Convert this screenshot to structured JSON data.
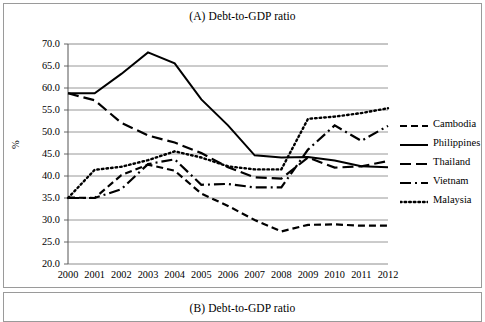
{
  "panel_a": {
    "title": "(A) Debt-to-GDP ratio"
  },
  "panel_b": {
    "title": "(B) Debt-to-GDP ratio"
  },
  "chart_data": {
    "type": "line",
    "title": "(A) Debt-to-GDP ratio",
    "xlabel": "",
    "ylabel": "%",
    "ylim": [
      20.0,
      70.0
    ],
    "ytick_step": 5.0,
    "grid": "horizontal",
    "legend_position": "right",
    "ytick_labels": [
      "70.0",
      "65.0",
      "60.0",
      "55.0",
      "50.0",
      "45.0",
      "40.0",
      "35.0",
      "30.0",
      "25.0",
      "20.0"
    ],
    "categories": [
      "2000",
      "2001",
      "2002",
      "2003",
      "2004",
      "2005",
      "2006",
      "2007",
      "2008",
      "2009",
      "2010",
      "2011",
      "2012"
    ],
    "x": [
      2000,
      2001,
      2002,
      2003,
      2004,
      2005,
      2006,
      2007,
      2008,
      2009,
      2010,
      2011,
      2012
    ],
    "series": [
      {
        "name": "Cambodia",
        "style": "dashed",
        "values": [
          35.1,
          35.0,
          40.2,
          42.6,
          41.2,
          36.0,
          33.2,
          30.0,
          27.4,
          28.9,
          29.0,
          28.7,
          28.7
        ]
      },
      {
        "name": "Philippines",
        "style": "solid",
        "values": [
          58.8,
          58.8,
          63.2,
          68.1,
          65.6,
          57.4,
          51.5,
          44.7,
          44.2,
          44.3,
          43.5,
          42.2,
          42.0
        ]
      },
      {
        "name": "Thailand",
        "style": "long-dash",
        "values": [
          58.8,
          57.2,
          52.1,
          49.2,
          47.6,
          45.2,
          42.0,
          39.7,
          39.4,
          44.2,
          41.9,
          42.2,
          43.4
        ]
      },
      {
        "name": "Vietnam",
        "style": "dash-dot",
        "values": [
          35.0,
          35.0,
          37.0,
          42.7,
          43.8,
          38.0,
          38.2,
          37.4,
          37.4,
          46.0,
          51.5,
          48.0,
          51.4
        ]
      },
      {
        "name": "Malaysia",
        "style": "dotted",
        "values": [
          35.0,
          41.4,
          42.1,
          43.6,
          45.6,
          44.2,
          42.2,
          41.5,
          41.5,
          53.0,
          53.5,
          54.3,
          55.4
        ]
      }
    ]
  },
  "legend": {
    "items": [
      {
        "label": "Cambodia",
        "style": "dashed"
      },
      {
        "label": "Philippines",
        "style": "solid"
      },
      {
        "label": "Thailand",
        "style": "long-dash"
      },
      {
        "label": "Vietnam",
        "style": "dash-dot"
      },
      {
        "label": "Malaysia",
        "style": "dotted"
      }
    ]
  }
}
